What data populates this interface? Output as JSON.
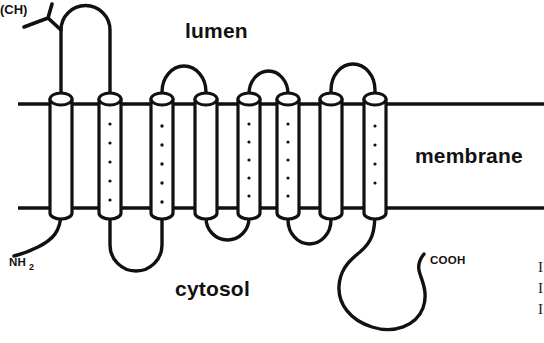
{
  "figure": {
    "type": "membrane-protein-topology-diagram",
    "title": "",
    "background_color": "#ffffff",
    "ink_color": "#111111"
  },
  "labels": {
    "lumen": "lumen",
    "membrane": "membrane",
    "cytosol": "cytosol",
    "n_terminus": "NH",
    "n_terminus_sub": "2",
    "c_terminus": "COOH",
    "glycosylation": "(CH)"
  },
  "membrane": {
    "top_y": 104,
    "bottom_y": 208,
    "left_x": 18,
    "right_x": 544
  },
  "helices": [
    {
      "id": 1,
      "x": 61,
      "dotted": false
    },
    {
      "id": 2,
      "x": 110,
      "dotted": true
    },
    {
      "id": 3,
      "x": 162,
      "dotted": true
    },
    {
      "id": 4,
      "x": 206,
      "dotted": false
    },
    {
      "id": 5,
      "x": 249,
      "dotted": true
    },
    {
      "id": 6,
      "x": 288,
      "dotted": true
    },
    {
      "id": 7,
      "x": 331,
      "dotted": false
    },
    {
      "id": 8,
      "x": 375,
      "dotted": true
    }
  ],
  "loops": {
    "lumenal": [
      {
        "between": [
          1,
          2
        ],
        "shape": "tall-hairpin"
      },
      {
        "between": [
          3,
          4
        ],
        "shape": "arch"
      },
      {
        "between": [
          5,
          6
        ],
        "shape": "arch"
      },
      {
        "between": [
          7,
          8
        ],
        "shape": "arch"
      }
    ],
    "cytosolic": [
      {
        "between": [
          2,
          3
        ],
        "shape": "deep-hairpin"
      },
      {
        "between": [
          4,
          5
        ],
        "shape": "arch"
      },
      {
        "between": [
          6,
          7
        ],
        "shape": "arch"
      }
    ]
  },
  "termini": {
    "n_terminus_side": "cytosol",
    "c_terminus_side": "cytosol"
  },
  "edge_fragments": [
    "I",
    "I",
    "I"
  ]
}
